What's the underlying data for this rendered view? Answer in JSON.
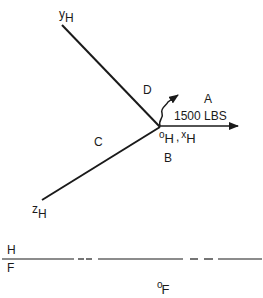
{
  "diagram": {
    "axes": {
      "y_axis": {
        "label": "y",
        "subscript": "H"
      },
      "z_axis": {
        "label": "z",
        "subscript": "H"
      },
      "origin_x": {
        "origin_label": "o",
        "origin_sub": "H",
        "separator": ",",
        "x_label": "x",
        "x_sub": "H"
      }
    },
    "regions": {
      "A": "A",
      "B": "B",
      "C": "C",
      "D": "D"
    },
    "force": {
      "label": "1500 LBS"
    },
    "interface": {
      "upper": "H",
      "lower": "F"
    },
    "frame_f_origin": {
      "label": "o",
      "subscript": "F"
    }
  },
  "colors": {
    "line": "#1a1a1a",
    "background": "#ffffff"
  }
}
